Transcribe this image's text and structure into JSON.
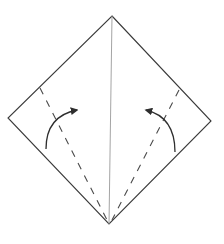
{
  "diagram": {
    "title": "Origami kite base fold step",
    "colors": {
      "background": "#ffffff",
      "outline": "#3a3a3a",
      "center_crease": "#9a9a9a",
      "valley_fold": "#4a4a4a",
      "arrow": "#2e2e2e"
    },
    "square": {
      "top": [
        112,
        16
      ],
      "right": [
        211,
        121
      ],
      "bottom": [
        109,
        224
      ],
      "left": [
        8,
        118
      ]
    },
    "center_crease": {
      "from": [
        112,
        16
      ],
      "to": [
        109,
        224
      ]
    },
    "valley_folds": [
      {
        "side": "left",
        "from": [
          40,
          88
        ],
        "to": [
          107,
          220
        ]
      },
      {
        "side": "right",
        "from": [
          179,
          90
        ],
        "to": [
          112,
          220
        ]
      }
    ],
    "arrows": [
      {
        "side": "left",
        "path": "M46 149 Q46 116 77 110",
        "head_at": [
          77,
          110
        ]
      },
      {
        "side": "right",
        "path": "M175 152 Q175 117 146 110",
        "head_at": [
          146,
          110
        ]
      }
    ]
  }
}
